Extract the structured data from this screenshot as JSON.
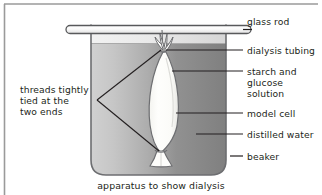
{
  "figure": {
    "caption": "apparatus to show dialysis",
    "labels_right": [
      {
        "id": "glass-rod",
        "text": "glass rod",
        "top": 16
      },
      {
        "id": "dialysis-tubing",
        "text": "dialysis tubing",
        "top": 45
      },
      {
        "id": "starch-line1",
        "text": "starch and",
        "top": 67
      },
      {
        "id": "starch-line2",
        "text": "glucose",
        "top": 78
      },
      {
        "id": "starch-line3",
        "text": "solution",
        "top": 89
      },
      {
        "id": "model-cell",
        "text": "model cell",
        "top": 109
      },
      {
        "id": "distilled-water",
        "text": "distilled water",
        "top": 130
      },
      {
        "id": "beaker",
        "text": "beaker",
        "top": 152
      }
    ],
    "labels_left": [
      {
        "id": "threads-line1",
        "text": "threads tightly",
        "top": 85
      },
      {
        "id": "threads-line2",
        "text": "tied at the",
        "top": 96
      },
      {
        "id": "threads-line3",
        "text": "two ends",
        "top": 107
      }
    ],
    "colors": {
      "outline": "#58595b",
      "text": "#231f20",
      "water_light": "#c9c9c9",
      "water_dark": "#828282",
      "beaker_empty_light": "#ececec",
      "beaker_empty_dark": "#d6d6d6",
      "cell_fill": "#fdfdfb",
      "rod_fill": "#f7f7f7",
      "border": "#9a9a9a"
    },
    "parts": {
      "glass_rod": "glass rod",
      "dialysis_tubing": "dialysis tubing",
      "model_cell": "model cell",
      "beaker": "beaker",
      "distilled_water": "distilled water",
      "starch_glucose_solution": "starch and glucose solution",
      "threads": "threads tightly tied at the two ends"
    }
  }
}
